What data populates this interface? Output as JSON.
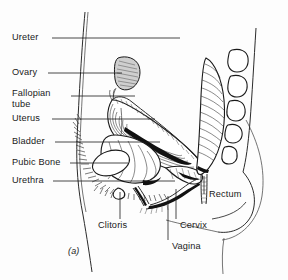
{
  "figure": {
    "caption": "(a)",
    "background_color": "#fdfdfd",
    "line_color": "#1a1a1a",
    "shade_color": "#cfcfcf"
  },
  "labels": {
    "left": [
      {
        "id": "ureter",
        "text": "Ureter"
      },
      {
        "id": "ovary",
        "text": "Ovary"
      },
      {
        "id": "fallopian-tube-1",
        "text": "Fallopian"
      },
      {
        "id": "fallopian-tube-2",
        "text": "tube"
      },
      {
        "id": "uterus",
        "text": "Uterus"
      },
      {
        "id": "bladder",
        "text": "Bladder"
      },
      {
        "id": "pubic-bone",
        "text": "Pubic Bone"
      },
      {
        "id": "urethra",
        "text": "Urethra"
      }
    ],
    "bottom": [
      {
        "id": "clitoris",
        "text": "Clitoris"
      },
      {
        "id": "cervix",
        "text": "Cervix"
      },
      {
        "id": "vagina",
        "text": "Vagina"
      }
    ],
    "right": [
      {
        "id": "rectum",
        "text": "Rectum"
      }
    ]
  }
}
